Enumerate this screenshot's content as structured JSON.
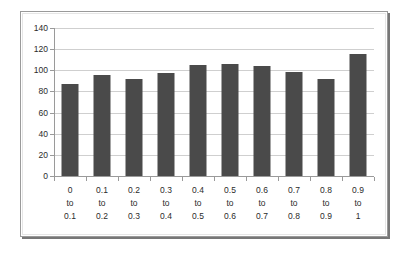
{
  "chart_data": {
    "type": "bar",
    "title": "",
    "subtitle": "",
    "xlabel": "",
    "ylabel": "",
    "categories": [
      "0 to 0.1",
      "0.1 to 0.2",
      "0.2 to 0.3",
      "0.3 to 0.4",
      "0.4 to 0.5",
      "0.5 to 0.6",
      "0.6 to 0.7",
      "0.7 to 0.8",
      "0.8 to 0.9",
      "0.9 to 1"
    ],
    "category_lines": [
      [
        "0",
        "to",
        "0.1"
      ],
      [
        "0.1",
        "to",
        "0.2"
      ],
      [
        "0.2",
        "to",
        "0.3"
      ],
      [
        "0.3",
        "to",
        "0.4"
      ],
      [
        "0.4",
        "to",
        "0.5"
      ],
      [
        "0.5",
        "to",
        "0.6"
      ],
      [
        "0.6",
        "to",
        "0.7"
      ],
      [
        "0.7",
        "to",
        "0.8"
      ],
      [
        "0.8",
        "to",
        "0.9"
      ],
      [
        "0.9",
        "to",
        "1"
      ]
    ],
    "values": [
      87,
      96,
      92,
      97,
      105,
      106,
      104,
      98,
      92,
      115
    ],
    "ylim": [
      0,
      140
    ],
    "ytick_step": 20,
    "yticks": [
      0,
      20,
      40,
      60,
      80,
      100,
      120,
      140
    ],
    "ytick_labels": [
      "0",
      "20",
      "40",
      "60",
      "80",
      "100",
      "120",
      "140"
    ],
    "grid": true,
    "grid_axis": "y",
    "legend": false,
    "legend_position": "none",
    "bar_color": "#4a4a4a",
    "gridline_color": "#cfcfcf",
    "axis_color": "#9a9a9a",
    "plot_background": "#ffffff"
  },
  "frame": {
    "border_color": "#9a9a9a",
    "shadow_color": "#777777",
    "background": "#ffffff"
  }
}
